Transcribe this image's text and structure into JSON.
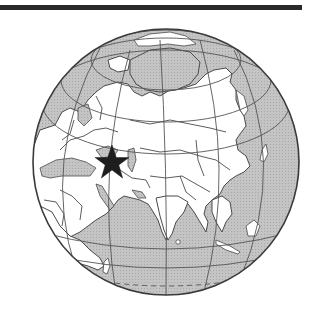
{
  "map": {
    "type": "orthographic-globe",
    "region_shown": "Eurasia, Indian Ocean, Arctic",
    "marker": {
      "shape": "star",
      "label": "",
      "approx_location": "Caucasus / Eastern Turkey region"
    },
    "colors": {
      "ocean": "#bdbdbd",
      "land": "#ffffff",
      "border": "#4a4a4a",
      "graticule": "#555555",
      "marker": "#1e1e1e",
      "top_bar": "#2a2a2a"
    },
    "features": [
      "top-rule",
      "globe",
      "graticule",
      "country-borders",
      "star-marker",
      "dashed-tropic-line"
    ]
  }
}
